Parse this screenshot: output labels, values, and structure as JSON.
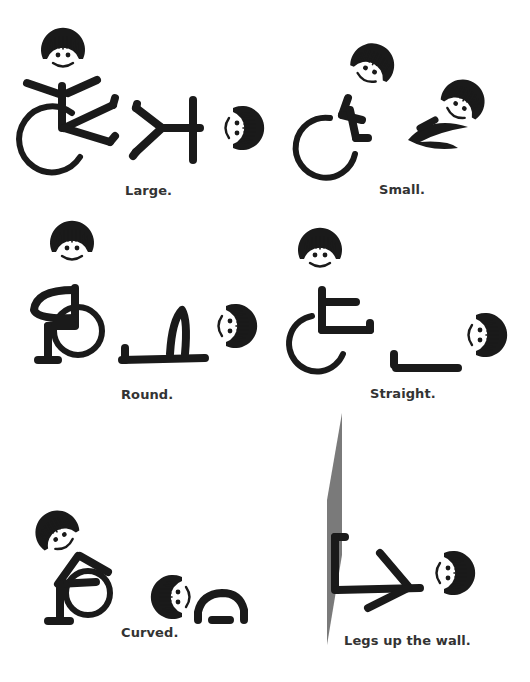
{
  "colors": {
    "ink": "#1a1a1a",
    "caption": "#333333",
    "wall": "#7a7a7a",
    "background": "#ffffff"
  },
  "panels": [
    {
      "id": "large",
      "caption": "Large.",
      "figures": [
        "seated-in-wheelchair",
        "lying-on-floor"
      ]
    },
    {
      "id": "small",
      "caption": "Small.",
      "figures": [
        "seated-in-wheelchair",
        "lying-on-floor"
      ]
    },
    {
      "id": "round",
      "caption": "Round.",
      "figures": [
        "seated-in-wheelchair",
        "lying-on-floor"
      ]
    },
    {
      "id": "straight",
      "caption": "Straight.",
      "figures": [
        "seated-in-wheelchair",
        "lying-on-floor"
      ]
    },
    {
      "id": "curved",
      "caption": "Curved.",
      "figures": [
        "seated-in-wheelchair",
        "lying-on-floor"
      ]
    },
    {
      "id": "legs-up-the-wall",
      "caption": "Legs up the wall.",
      "figures": [
        "wall",
        "lying-on-floor"
      ]
    }
  ]
}
